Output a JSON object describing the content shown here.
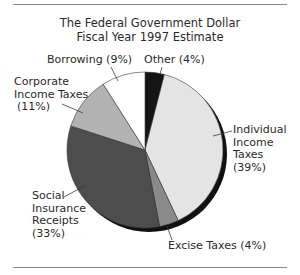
{
  "title": {
    "line1": "The Federal Government Dollar",
    "line2": "Fiscal Year 1997 Estimate"
  },
  "labels": {
    "other": "Other (4%)",
    "individual": [
      "Individual",
      "Income",
      "Taxes",
      "(39%)"
    ],
    "excise": "Excise Taxes (4%)",
    "social": [
      "Social",
      "Insurance",
      "Receipts",
      "(33%)"
    ],
    "corporate": [
      "Corporate",
      "Income Taxes",
      "(11%)"
    ],
    "borrowing": "Borrowing (9%)"
  },
  "colors": {
    "other": "#141414",
    "individual": "#e4e4e4",
    "excise": "#8a8a8a",
    "social": "#4d4d4d",
    "corporate": "#b3b3b3",
    "borrowing": "#ffffff",
    "shadow": "#111111",
    "outline": "#3a3a3a"
  },
  "chart_data": {
    "type": "pie",
    "title": "The Federal Government Dollar",
    "subtitle": "Fiscal Year 1997 Estimate",
    "categories": [
      "Other",
      "Individual Income Taxes",
      "Excise Taxes",
      "Social Insurance Receipts",
      "Corporate Income Taxes",
      "Borrowing"
    ],
    "values": [
      4,
      39,
      4,
      33,
      11,
      9
    ],
    "unit": "%",
    "start_angle": "12 o'clock",
    "direction": "clockwise",
    "legend": "none (direct labels with leader lines)"
  }
}
